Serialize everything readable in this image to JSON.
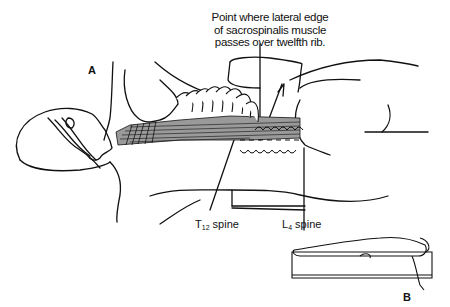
{
  "figure": {
    "panel_a_label": "A",
    "panel_b_label": "B",
    "callout": {
      "line1": "Point where lateral edge",
      "line2": "of sacrospinalis muscle",
      "line3": "passes over twelfth rib."
    },
    "labels": {
      "t12_prefix": "T",
      "t12_sub": "12",
      "t12_suffix": " spine",
      "l4_prefix": "L",
      "l4_sub": "4",
      "l4_suffix": " spine"
    },
    "colors": {
      "ink": "#111111",
      "muscle_shade": "#8a8a8a",
      "paper": "#ffffff"
    }
  }
}
